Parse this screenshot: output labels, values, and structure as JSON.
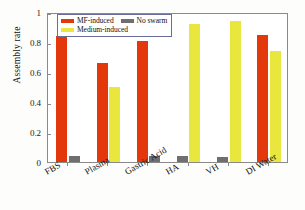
{
  "chart_data": {
    "type": "bar",
    "title": "",
    "xlabel": "",
    "ylabel": "Assembly rate",
    "ylim": [
      0,
      1
    ],
    "yticks": [
      "0",
      "0.2",
      "0.4",
      "0.6",
      "0.8",
      "1"
    ],
    "ytick_values": [
      0,
      0.2,
      0.4,
      0.6,
      0.8,
      1
    ],
    "grid": false,
    "legend_position": "top-left-inside",
    "categories": [
      "FBS",
      "Plasma",
      "Gastric Acid",
      "HA",
      "VH",
      "DI Water"
    ],
    "series": [
      {
        "name": "MF-induced",
        "color": "#e2380c",
        "values": [
          0.84,
          0.66,
          0.81,
          null,
          null,
          0.85
        ]
      },
      {
        "name": "No swarm",
        "color": "#6f6f6f",
        "values": [
          0.04,
          null,
          0.04,
          0.04,
          0.035,
          null
        ]
      },
      {
        "name": "Medium-induced",
        "color": "#e9e63d",
        "values": [
          null,
          0.5,
          null,
          0.92,
          0.94,
          0.74
        ]
      }
    ]
  },
  "legend": {
    "entries": [
      {
        "label": "MF-induced",
        "swatch": "s0"
      },
      {
        "label": "No swarm",
        "swatch": "s1"
      },
      {
        "label": "Medium-induced",
        "swatch": "s2"
      }
    ]
  },
  "axes": {
    "y_label": "Assembly rate"
  }
}
